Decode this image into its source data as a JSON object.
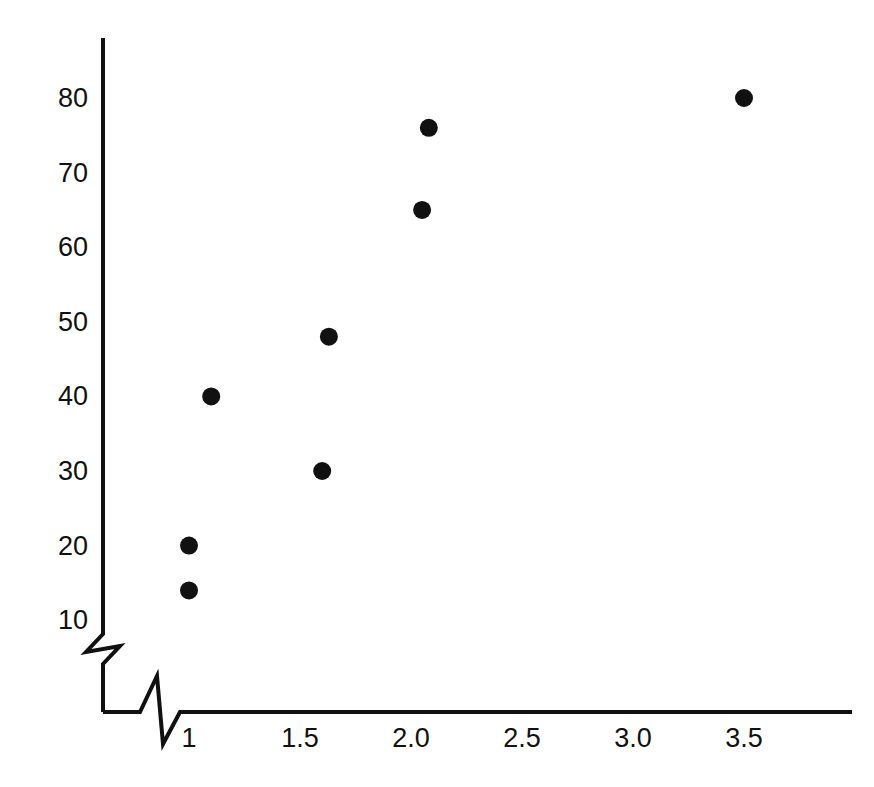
{
  "chart_data": {
    "type": "scatter",
    "title": "",
    "xlabel": "",
    "ylabel": "",
    "xlim": [
      0.72,
      3.8
    ],
    "ylim": [
      5,
      86
    ],
    "grid": false,
    "legend": null,
    "axis_break": {
      "x_axis": true,
      "y_axis": true,
      "note": "zigzag break symbol near origin on both axes"
    },
    "xticks": [
      {
        "label": "1",
        "value": 1
      },
      {
        "label": "1.5",
        "value": 1.5
      },
      {
        "label": "2.0",
        "value": 2.0
      },
      {
        "label": "2.5",
        "value": 2.5
      },
      {
        "label": "3.0",
        "value": 3.0
      },
      {
        "label": "3.5",
        "value": 3.5
      }
    ],
    "yticks": [
      {
        "label": "10",
        "value": 10
      },
      {
        "label": "20",
        "value": 20
      },
      {
        "label": "30",
        "value": 30
      },
      {
        "label": "40",
        "value": 40
      },
      {
        "label": "50",
        "value": 50
      },
      {
        "label": "60",
        "value": 60
      },
      {
        "label": "70",
        "value": 70
      },
      {
        "label": "80",
        "value": 80
      }
    ],
    "points": [
      {
        "x": 1.0,
        "y": 14
      },
      {
        "x": 1.0,
        "y": 20
      },
      {
        "x": 1.1,
        "y": 40
      },
      {
        "x": 1.6,
        "y": 30
      },
      {
        "x": 1.63,
        "y": 48
      },
      {
        "x": 2.05,
        "y": 65
      },
      {
        "x": 2.08,
        "y": 76
      },
      {
        "x": 3.5,
        "y": 80
      }
    ],
    "marker": {
      "shape": "circle",
      "color": "#111111",
      "radius_px": 9
    },
    "axis_color": "#111111"
  }
}
